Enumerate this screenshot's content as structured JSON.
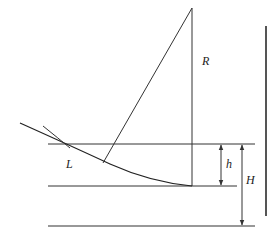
{
  "diagram": {
    "labels": {
      "R": "R",
      "L": "L",
      "h": "h",
      "H": "H"
    },
    "colors": {
      "line": "#333333",
      "bar": "#555555",
      "background": "#ffffff"
    }
  }
}
